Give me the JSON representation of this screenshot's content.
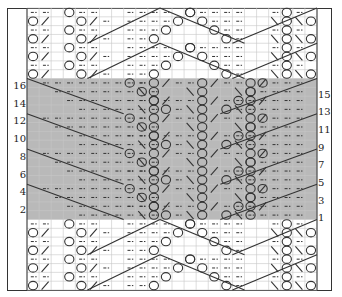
{
  "chart": {
    "grid": {
      "columns": 24,
      "rows": 32,
      "left": 27,
      "top": 8,
      "right": 317,
      "bottom": 290
    },
    "shaded_band": {
      "first_row": 1,
      "last_row": 16,
      "color": "#b9b9b9"
    },
    "colors": {
      "grid_line": "#c8c8c8",
      "symbol": "#333333",
      "border": "#333333",
      "background": "#ffffff"
    },
    "symbols": {
      "purl": "dash",
      "yarn_over": "circle",
      "k2tog": "slash-right",
      "ssk": "slash-left",
      "long_decrease": "diagonal-line"
    }
  },
  "row_numbers": {
    "left": [
      "16",
      "14",
      "12",
      "10",
      "8",
      "6",
      "4",
      "2"
    ],
    "right": [
      "15",
      "13",
      "11",
      "9",
      "7",
      "5",
      "3",
      "1"
    ]
  }
}
